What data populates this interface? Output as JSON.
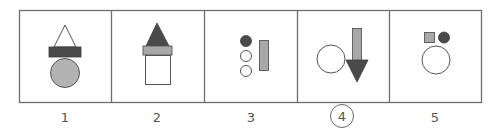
{
  "colors": {
    "border": "#6e6e6e",
    "dark": "#4a4a4a",
    "mid_gray": "#a8a8a8",
    "circle_gray": "#b3b3b3",
    "outline": "#555555",
    "white": "#ffffff",
    "label": "#555555"
  },
  "panels": [
    {
      "label": "1",
      "selected": false,
      "description": "outlined triangle atop dark bar atop gray circle"
    },
    {
      "label": "2",
      "selected": false,
      "description": "dark triangle atop gray bar atop white square"
    },
    {
      "label": "3",
      "selected": false,
      "description": "one dark and two white small circles beside gray vertical bar"
    },
    {
      "label": "4",
      "selected": true,
      "description": "white circle beside gray down arrow with dark arrowhead"
    },
    {
      "label": "5",
      "selected": false,
      "description": "gray square and dark circle above white circle"
    }
  ]
}
